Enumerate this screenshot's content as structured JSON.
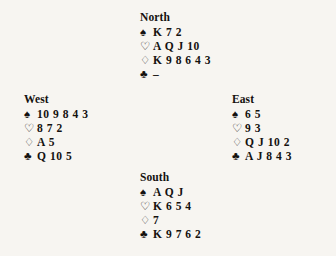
{
  "diagram": {
    "type": "bridge-deal",
    "suit_glyphs": {
      "spades": "♠",
      "hearts": "♡",
      "diamonds": "♢",
      "clubs": "♣"
    },
    "void_marker": "–",
    "ink_color": "#14110f",
    "paper_color": "#f7f5f1"
  },
  "hands": {
    "north": {
      "label": "North",
      "spades": "K 7 2",
      "hearts": "A Q J 10",
      "diamonds": "K 9 8 6 4 3",
      "clubs": "–"
    },
    "west": {
      "label": "West",
      "spades": "10 9 8 4 3",
      "hearts": "8 7 2",
      "diamonds": "A 5",
      "clubs": "Q 10 5"
    },
    "east": {
      "label": "East",
      "spades": "6 5",
      "hearts": "9 3",
      "diamonds": "Q J 10 2",
      "clubs": "A J 8 4 3"
    },
    "south": {
      "label": "South",
      "spades": "A Q J",
      "hearts": "K 6 5 4",
      "diamonds": "7",
      "clubs": "K 9 7 6 2"
    }
  }
}
